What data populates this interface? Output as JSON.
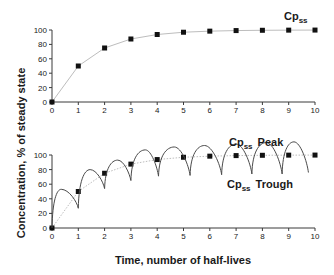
{
  "chart_data": [
    {
      "type": "line",
      "panel": "top",
      "title": "",
      "xlabel": "",
      "ylabel": "% of steady state",
      "x": [
        0,
        1,
        2,
        3,
        4,
        5,
        6,
        7,
        8,
        9,
        10
      ],
      "xlim": [
        0,
        10
      ],
      "ylim": [
        0,
        100
      ],
      "xticks": [
        "0",
        "1",
        "2",
        "3",
        "4",
        "5",
        "6",
        "7",
        "8",
        "9",
        "10"
      ],
      "yticks": [
        "0",
        "20",
        "40",
        "60",
        "80",
        "100"
      ],
      "grid": false,
      "series": [
        {
          "name": "Cpss accumulation",
          "marker": "square",
          "values": [
            0,
            50,
            75,
            87.5,
            93.75,
            96.9,
            98.4,
            99.2,
            99.6,
            99.8,
            99.9
          ]
        }
      ],
      "annotations": [
        {
          "text": "Cp",
          "sub": "ss",
          "x": 8.9,
          "y": 110
        }
      ]
    },
    {
      "type": "line",
      "panel": "bottom",
      "title": "",
      "xlabel": "Time, number of half-lives",
      "ylabel": "Concentration",
      "x": [
        0,
        1,
        2,
        3,
        4,
        5,
        6,
        7,
        8,
        9,
        10
      ],
      "xlim": [
        0,
        10
      ],
      "ylim": [
        0,
        100
      ],
      "xticks": [
        "0",
        "1",
        "2",
        "3",
        "4",
        "5",
        "6",
        "7",
        "8",
        "9",
        "10"
      ],
      "yticks": [
        "0",
        "20",
        "40",
        "60",
        "80",
        "100"
      ],
      "grid": false,
      "series": [
        {
          "name": "Cpss (mean)",
          "marker": "square",
          "values": [
            0,
            50,
            75,
            87.5,
            93.75,
            96.9,
            98.4,
            99.2,
            99.6,
            99.8,
            99.9
          ]
        },
        {
          "name": "Concentration (repeated dosing)",
          "marker": "none",
          "troughs": [
            {
              "x": 0.0,
              "y": 0
            },
            {
              "x": 1.0,
              "y": 27
            },
            {
              "x": 2.0,
              "y": 54
            },
            {
              "x": 3.0,
              "y": 65
            },
            {
              "x": 4.05,
              "y": 71
            },
            {
              "x": 5.25,
              "y": 72
            },
            {
              "x": 6.45,
              "y": 73
            },
            {
              "x": 7.6,
              "y": 74
            },
            {
              "x": 8.75,
              "y": 74
            },
            {
              "x": 9.75,
              "y": 76
            }
          ],
          "peaks": [
            {
              "x": 0.35,
              "y": 53
            },
            {
              "x": 1.45,
              "y": 80
            },
            {
              "x": 2.5,
              "y": 93
            },
            {
              "x": 3.55,
              "y": 107
            },
            {
              "x": 4.65,
              "y": 111
            },
            {
              "x": 5.8,
              "y": 113
            },
            {
              "x": 7.0,
              "y": 115
            },
            {
              "x": 8.15,
              "y": 117
            },
            {
              "x": 9.2,
              "y": 118
            }
          ]
        }
      ],
      "annotations": [
        {
          "text": "Cp",
          "sub": "ss",
          "suffix": "Peak",
          "x": 6.4,
          "y": 127
        },
        {
          "text": "Cp",
          "sub": "ss",
          "suffix": "Trough",
          "x": 6.2,
          "y": 63
        }
      ]
    }
  ],
  "labels": {
    "y_axis_title": "Concentration, % of steady state",
    "x_axis_title": "Time, number of half-lives",
    "top_cpss": "Cp",
    "top_cpss_sub": "ss",
    "peak_cp": "Cp",
    "peak_sub": "ss",
    "peak_word": "Peak",
    "trough_cp": "Cp",
    "trough_sub": "ss",
    "trough_word": "Trough"
  },
  "colors": {
    "axis": "#3a3a3a",
    "marker": "#111111",
    "trend_line": "#bdbdbd",
    "curve": "#4a4a4a"
  }
}
